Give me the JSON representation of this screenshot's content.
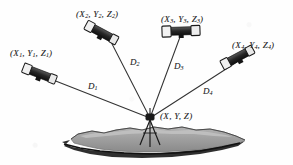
{
  "figure": {
    "type": "technical-diagram",
    "background_color": "#fefefe",
    "ink_color": "#2b2b2b",
    "terrain_color": "#9a9a9a",
    "terrain_shadow_color": "#1c1c1c"
  },
  "stations": [
    {
      "id": "station-1",
      "label_x": "X",
      "label_y": "Y",
      "label_z": "Z",
      "subscript": "1",
      "label_full": "(X1, Y1, Z1)",
      "open_paren": "(",
      "close_paren": ")",
      "comma": ","
    },
    {
      "id": "station-2",
      "label_x": "X",
      "label_y": "Y",
      "label_z": "Z",
      "subscript": "2",
      "label_full": "(X2, Y2, Z2)",
      "open_paren": "(",
      "close_paren": ")",
      "comma": ","
    },
    {
      "id": "station-3",
      "label_x": "X",
      "label_y": "Y",
      "label_z": "Z",
      "subscript": "3",
      "label_full": "(X3, Y3, Z3)",
      "open_paren": "(",
      "close_paren": ")",
      "comma": ","
    },
    {
      "id": "station-4",
      "label_x": "X",
      "label_y": "Y",
      "label_z": "Z",
      "subscript": "4",
      "label_full": "(X4, Y4, Z4)",
      "open_paren": "(",
      "close_paren": ")",
      "comma": ","
    }
  ],
  "distances": [
    {
      "id": "distance-1",
      "symbol": "D",
      "subscript": "1"
    },
    {
      "id": "distance-2",
      "symbol": "D",
      "subscript": "2"
    },
    {
      "id": "distance-3",
      "symbol": "D",
      "subscript": "3"
    },
    {
      "id": "distance-4",
      "symbol": "D",
      "subscript": "4"
    }
  ],
  "target": {
    "id": "target-point",
    "label_x": "X",
    "label_y": "Y",
    "label_z": "Z",
    "label_full": "(X, Y, Z)",
    "open_paren": "(",
    "close_paren": ")",
    "comma": ","
  }
}
